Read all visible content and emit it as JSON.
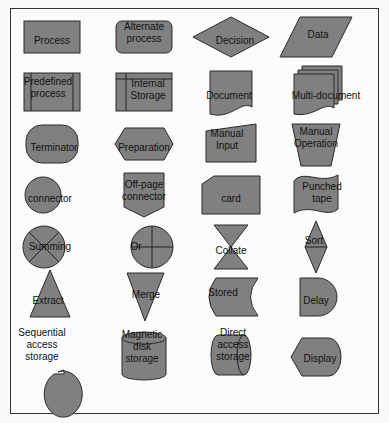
{
  "diagram": {
    "fill_color": "#808080",
    "stroke_color": "#2a2a2a",
    "background": "#fbfbfb",
    "symbols": [
      {
        "id": "process",
        "shape": "rect",
        "lines": [
          "Process"
        ]
      },
      {
        "id": "alternate-process",
        "shape": "rounded-rect",
        "lines": [
          "Alternate",
          "process"
        ]
      },
      {
        "id": "decision",
        "shape": "diamond",
        "lines": [
          "Decision"
        ]
      },
      {
        "id": "data",
        "shape": "parallelogram",
        "lines": [
          "Data"
        ]
      },
      {
        "id": "predefined-process",
        "shape": "predefined",
        "lines": [
          "Predefined",
          "process"
        ]
      },
      {
        "id": "internal-storage",
        "shape": "internal-storage",
        "lines": [
          "Internal",
          "Storage"
        ]
      },
      {
        "id": "document",
        "shape": "document",
        "lines": [
          "Document"
        ]
      },
      {
        "id": "multi-document",
        "shape": "multi-document",
        "lines": [
          "Multi-document"
        ]
      },
      {
        "id": "terminator",
        "shape": "terminator",
        "lines": [
          "Terminator"
        ]
      },
      {
        "id": "preparation",
        "shape": "hexagon",
        "lines": [
          "Preparation"
        ]
      },
      {
        "id": "manual-input",
        "shape": "manual-input",
        "lines": [
          "Manual",
          "Input"
        ]
      },
      {
        "id": "manual-operation",
        "shape": "trapezoid",
        "lines": [
          "Manual",
          "Operation"
        ]
      },
      {
        "id": "connector",
        "shape": "circle",
        "lines": [
          "connector"
        ]
      },
      {
        "id": "off-page-connector",
        "shape": "off-page",
        "lines": [
          "Off-page",
          "connector"
        ]
      },
      {
        "id": "card",
        "shape": "card",
        "lines": [
          "card"
        ]
      },
      {
        "id": "punched-tape",
        "shape": "punched-tape",
        "lines": [
          "Punched",
          "tape"
        ]
      },
      {
        "id": "summing",
        "shape": "summing",
        "lines": [
          "Summing"
        ]
      },
      {
        "id": "or",
        "shape": "or",
        "lines": [
          "Or"
        ]
      },
      {
        "id": "collate",
        "shape": "collate",
        "lines": [
          "Collate"
        ]
      },
      {
        "id": "sort",
        "shape": "sort",
        "lines": [
          "Sort"
        ]
      },
      {
        "id": "extract",
        "shape": "triangle-up",
        "lines": [
          "Extract"
        ]
      },
      {
        "id": "merge",
        "shape": "triangle-down",
        "lines": [
          "Merge"
        ]
      },
      {
        "id": "stored",
        "shape": "stored-data",
        "lines": [
          "Stored"
        ]
      },
      {
        "id": "delay",
        "shape": "delay",
        "lines": [
          "Delay"
        ]
      },
      {
        "id": "sequential-access-storage",
        "shape": "sequential",
        "lines": [
          "Sequential",
          "access",
          "storage"
        ]
      },
      {
        "id": "magnetic-disk-storage",
        "shape": "cylinder",
        "lines": [
          "Magnetic",
          "disk",
          "storage"
        ]
      },
      {
        "id": "direct-access-storage",
        "shape": "direct-access",
        "lines": [
          "Direct",
          "access",
          "storage"
        ]
      },
      {
        "id": "display",
        "shape": "display",
        "lines": [
          "Display"
        ]
      }
    ]
  }
}
